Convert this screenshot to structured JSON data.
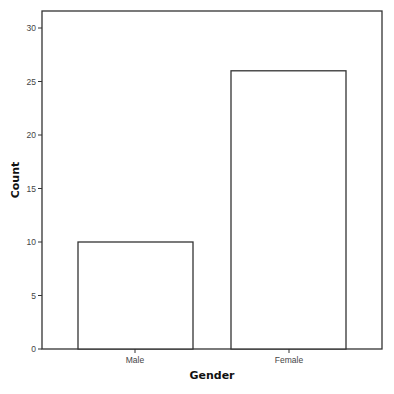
{
  "chart_data": {
    "type": "bar",
    "title": "",
    "categories": [
      "Male",
      "Female"
    ],
    "values": [
      10,
      26
    ],
    "xlabel": "Gender",
    "ylabel": "Count",
    "ylim": [
      0,
      31.6
    ],
    "yticks": [
      0,
      5,
      10,
      15,
      20,
      25,
      30
    ],
    "grid": false,
    "legend": null,
    "bar_fill": "#ffffff",
    "bar_stroke": "#333333",
    "frame_color": "#333333"
  }
}
